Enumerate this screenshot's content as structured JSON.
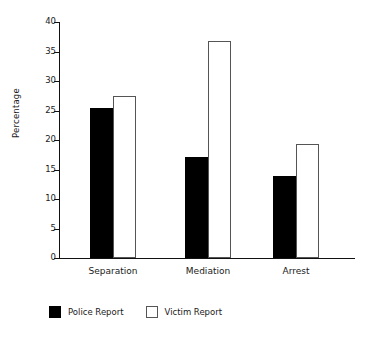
{
  "chart_data": {
    "type": "bar",
    "title": "",
    "subtitle": "",
    "xlabel": "",
    "ylabel": "Percentage",
    "categories": [
      "Separation",
      "Mediation",
      "Arrest"
    ],
    "series": [
      {
        "name": "Police Report",
        "color": "#000000",
        "values": [
          25.4,
          17.2,
          13.9
        ]
      },
      {
        "name": "Victim Report",
        "color": "#ffffff",
        "values": [
          27.5,
          36.7,
          19.4
        ]
      }
    ],
    "ylim": [
      0,
      40
    ],
    "ytick_values": [
      0,
      5,
      10,
      15,
      20,
      25,
      30,
      35,
      40
    ],
    "ytick_labels": [
      "0",
      "5",
      "10",
      "15",
      "20",
      "25",
      "30",
      "35",
      "40"
    ],
    "grid": false,
    "legend_position": "bottom-left",
    "legend_entries": [
      "Police Report",
      "Victim Report"
    ]
  },
  "icons": {
    "swatch_police": "filled-square-icon",
    "swatch_victim": "outlined-square-icon"
  }
}
